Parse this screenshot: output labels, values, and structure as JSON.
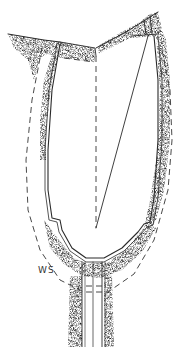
{
  "figure": {
    "type": "technical-illustration",
    "labels": [
      {
        "id": "ws",
        "text": "WS",
        "x": 38,
        "y": 270
      }
    ],
    "colors": {
      "line": "#2a2a2a",
      "shade": "#8a8a8a",
      "background": "#ffffff"
    }
  }
}
